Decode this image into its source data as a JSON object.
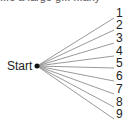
{
  "diagram": {
    "caption_partial": "...e a large g... ...any",
    "start_label": "Start",
    "line_color": "#9a9a9a",
    "branches": [
      {
        "label": "1",
        "y": 18
      },
      {
        "label": "2",
        "y": 30
      },
      {
        "label": "3",
        "y": 43
      },
      {
        "label": "4",
        "y": 56
      },
      {
        "label": "5",
        "y": 68
      },
      {
        "label": "6",
        "y": 81
      },
      {
        "label": "7",
        "y": 94
      },
      {
        "label": "8",
        "y": 107
      },
      {
        "label": "9",
        "y": 119
      }
    ]
  }
}
